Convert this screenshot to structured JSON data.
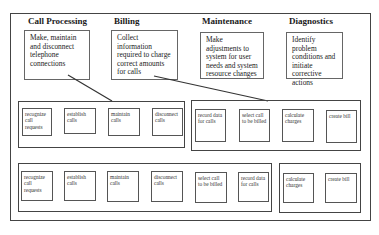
{
  "functions": [
    {
      "title": "Call Processing",
      "description": "Make, maintain and disconnect telephone connections"
    },
    {
      "title": "Billing",
      "description": "Collect information required to charge correct amounts for calls"
    },
    {
      "title": "Maintenance",
      "description": "Make adjustments to system for user needs and system resource changes"
    },
    {
      "title": "Diagnostics",
      "description": "Identify problem conditions and initiate corrective actions"
    }
  ],
  "row1": {
    "group1": [
      "recognize call requests",
      "establish calls",
      "maintain calls",
      "disconnect calls"
    ],
    "group2": [
      "record data for calls",
      "select call to be billed",
      "calculate charges",
      "create bill"
    ]
  },
  "row2": {
    "group1": [
      "recognize call requests",
      "establish calls",
      "maintain calls",
      "disconnect calls",
      "select call to be billed",
      "record data for calls"
    ],
    "group2": [
      "calculate charges",
      "create bill"
    ]
  },
  "colors": {
    "line": "#333333",
    "border": "#444444",
    "background": "#ffffff"
  }
}
